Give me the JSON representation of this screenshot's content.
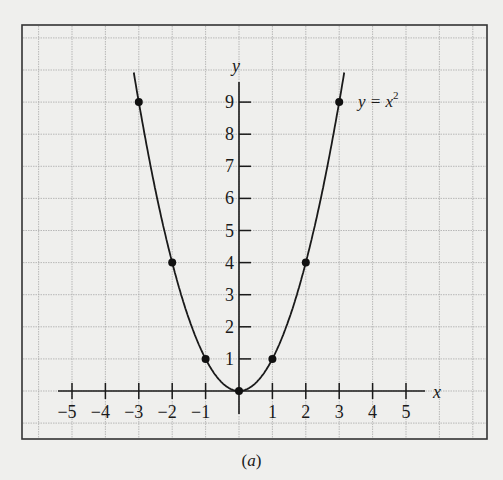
{
  "chart_data": {
    "type": "line",
    "title": "",
    "curve_label": "y = x²",
    "curve_label_parts": {
      "base": "y = x",
      "exp": "2"
    },
    "xlabel": "x",
    "ylabel": "y",
    "function": "y = x^2",
    "x_ticks": [
      -5,
      -4,
      -3,
      -2,
      -1,
      1,
      2,
      3,
      4,
      5
    ],
    "y_ticks": [
      1,
      2,
      3,
      4,
      5,
      6,
      7,
      8,
      9
    ],
    "xlim": [
      -5.5,
      5.5
    ],
    "ylim": [
      0,
      9.5
    ],
    "grid": true,
    "points": [
      {
        "x": -3,
        "y": 9
      },
      {
        "x": -2,
        "y": 4
      },
      {
        "x": -1,
        "y": 1
      },
      {
        "x": 0,
        "y": 0
      },
      {
        "x": 1,
        "y": 1
      },
      {
        "x": 2,
        "y": 4
      },
      {
        "x": 3,
        "y": 9
      }
    ],
    "x": [
      -3,
      -2,
      -1,
      0,
      1,
      2,
      3
    ],
    "series": [
      {
        "name": "y = x²",
        "values": [
          9,
          4,
          1,
          0,
          1,
          4,
          9
        ]
      }
    ],
    "caption": "(a)"
  },
  "caption": {
    "open": "(",
    "letter": "a",
    "close": ")"
  }
}
